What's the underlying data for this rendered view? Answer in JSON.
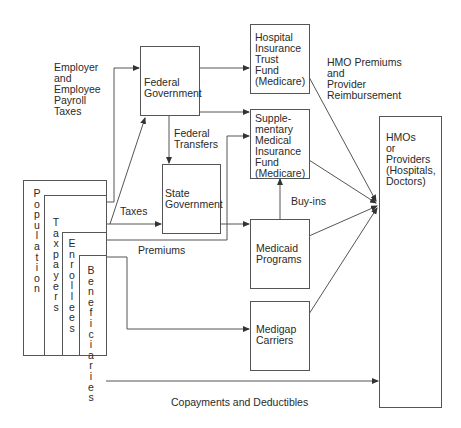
{
  "diagram": {
    "type": "flow",
    "nodes": {
      "federal": {
        "label": "Federal\nGovernment"
      },
      "hospital": {
        "label": "Hospital\nInsurance\nTrust\nFund\n(Medicare)"
      },
      "smi": {
        "label": "Supple-\nmentary\nMedical\nInsurance\nFund\n(Medicare)"
      },
      "state": {
        "label": "State\nGovernment"
      },
      "medicaid": {
        "label": "Medicaid\nPrograms"
      },
      "medigap": {
        "label": "Medigap\nCarriers"
      },
      "hmos": {
        "label": "HMOs\nor\nProviders\n(Hospitals,\nDoctors)"
      },
      "population": {
        "label": "P\no\np\nu\nl\na\nt\ni\no\nn"
      },
      "taxpayers": {
        "label": "T\na\nx\np\na\ny\ne\nr\ns"
      },
      "enrollees": {
        "label": "E\nn\nr\no\nl\nl\ne\ne\ns"
      },
      "beneficiaries": {
        "label": "B\ne\nn\ne\nf\ni\nc\ni\na\nr\ni\ne\ns"
      }
    },
    "edge_labels": {
      "payroll": "Employer\nand\nEmployee\nPayroll\nTaxes",
      "federal_transfers": "Federal\nTransfers",
      "taxes": "Taxes",
      "premiums": "Premiums",
      "buy_ins": "Buy-ins",
      "hmo_premiums": "HMO Premiums\nand\nProvider\nReimbursement",
      "copayments": "Copayments and Deductibles"
    }
  }
}
